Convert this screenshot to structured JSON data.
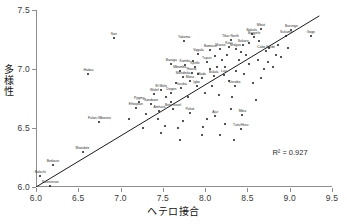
{
  "chart_data": {
    "type": "scatter",
    "title": "",
    "xlabel": "ヘテロ接合",
    "ylabel": "多様性",
    "xlim": [
      6.0,
      9.5
    ],
    "ylim": [
      6.0,
      7.5
    ],
    "xticks": [
      "6.0",
      "6.5",
      "7.0",
      "7.5",
      "8.0",
      "8.5",
      "9.0",
      "9.5"
    ],
    "yticks": [
      "6.0",
      "6.5",
      "7.0",
      "7.5"
    ],
    "grid": false,
    "legend": null,
    "annotations": [
      {
        "text": "R² = 0.927",
        "x": 9.15,
        "y": 6.28
      }
    ],
    "trendline": {
      "type": "linear",
      "x0": 6.0,
      "y0": 6.0,
      "x1": 9.35,
      "y1": 7.45,
      "r2": 0.927
    },
    "points": [
      {
        "label": "Palestinian",
        "x": 6.17,
        "y": 6.01
      },
      {
        "label": "Balochi",
        "x": 6.05,
        "y": 6.09
      },
      {
        "label": "Bedouin",
        "x": 6.2,
        "y": 6.19
      },
      {
        "label": "Mozabite",
        "x": 6.55,
        "y": 6.3
      },
      {
        "label": "Fulani Mbororo",
        "x": 6.75,
        "y": 6.55
      },
      {
        "label": "Hadza",
        "x": 6.62,
        "y": 6.96
      },
      {
        "label": "San",
        "x": 6.92,
        "y": 7.26
      },
      {
        "label": "Yakoma",
        "x": 7.75,
        "y": 7.24
      },
      {
        "label": "Tikar North",
        "x": 8.3,
        "y": 7.25
      },
      {
        "label": "Bakola",
        "x": 8.55,
        "y": 7.3
      },
      {
        "label": "Mbuti",
        "x": 8.66,
        "y": 7.34
      },
      {
        "label": "Bagyele",
        "x": 8.58,
        "y": 7.27
      },
      {
        "label": "Burunge",
        "x": 9.02,
        "y": 7.33
      },
      {
        "label": "Sukuma",
        "x": 8.96,
        "y": 7.28
      },
      {
        "label": "Gogo",
        "x": 9.25,
        "y": 7.28
      },
      {
        "label": "Baraga",
        "x": 7.6,
        "y": 7.04
      },
      {
        "label": "Vagala",
        "x": 7.92,
        "y": 7.13
      },
      {
        "label": "Bamoun",
        "x": 8.06,
        "y": 7.16
      },
      {
        "label": "Massa",
        "x": 8.18,
        "y": 7.17
      },
      {
        "label": "Malgas",
        "x": 8.36,
        "y": 7.17
      },
      {
        "label": "Kotu",
        "x": 8.28,
        "y": 7.19
      },
      {
        "label": "Sokoro",
        "x": 8.45,
        "y": 7.2
      },
      {
        "label": "Cabo Verde",
        "x": 8.72,
        "y": 7.15
      },
      {
        "label": "Kambu",
        "x": 7.76,
        "y": 7.03
      },
      {
        "label": "Kpelle",
        "x": 7.88,
        "y": 7.02
      },
      {
        "label": "Tupuri",
        "x": 8.02,
        "y": 7.06
      },
      {
        "label": "Mbamba",
        "x": 7.7,
        "y": 6.98
      },
      {
        "label": "Hausa",
        "x": 7.84,
        "y": 6.97
      },
      {
        "label": "Mandinka",
        "x": 7.74,
        "y": 6.93
      },
      {
        "label": "Mano",
        "x": 7.82,
        "y": 6.9
      },
      {
        "label": "Mada",
        "x": 7.96,
        "y": 6.92
      },
      {
        "label": "Bulala",
        "x": 8.1,
        "y": 6.94
      },
      {
        "label": "Luo",
        "x": 8.22,
        "y": 6.95
      },
      {
        "label": "El Molo",
        "x": 7.48,
        "y": 6.82
      },
      {
        "label": "Wolof",
        "x": 7.4,
        "y": 6.79
      },
      {
        "label": "Dogon",
        "x": 7.6,
        "y": 6.8
      },
      {
        "label": "Yoruba",
        "x": 7.72,
        "y": 6.84
      },
      {
        "label": "Igbo",
        "x": 7.9,
        "y": 6.86
      },
      {
        "label": "Dorobo",
        "x": 8.35,
        "y": 6.86
      },
      {
        "label": "Pygmy",
        "x": 7.22,
        "y": 6.72
      },
      {
        "label": "Sandawe",
        "x": 7.36,
        "y": 6.7
      },
      {
        "label": "Ethiopian",
        "x": 7.18,
        "y": 6.67
      },
      {
        "label": "Beta Israel",
        "x": 7.62,
        "y": 6.66
      },
      {
        "label": "Amhara",
        "x": 7.46,
        "y": 6.64
      },
      {
        "label": "Pokot",
        "x": 7.82,
        "y": 6.63
      },
      {
        "label": "Ajur",
        "x": 8.12,
        "y": 6.6
      },
      {
        "label": "Mbia",
        "x": 8.44,
        "y": 6.61
      },
      {
        "label": "Tutsi/Hutu",
        "x": 8.42,
        "y": 6.49
      },
      {
        "label": "",
        "x": 7.52,
        "y": 6.52
      },
      {
        "label": "",
        "x": 7.68,
        "y": 6.5
      },
      {
        "label": "",
        "x": 7.98,
        "y": 6.51
      },
      {
        "label": "",
        "x": 8.24,
        "y": 6.53
      },
      {
        "label": "",
        "x": 8.3,
        "y": 6.66
      },
      {
        "label": "",
        "x": 8.6,
        "y": 6.74
      },
      {
        "label": "",
        "x": 8.66,
        "y": 6.92
      },
      {
        "label": "",
        "x": 8.8,
        "y": 7.02
      },
      {
        "label": "",
        "x": 8.9,
        "y": 7.1
      },
      {
        "label": "",
        "x": 8.52,
        "y": 7.04
      },
      {
        "label": "",
        "x": 8.4,
        "y": 7.08
      },
      {
        "label": "",
        "x": 8.2,
        "y": 7.08
      },
      {
        "label": "",
        "x": 8.06,
        "y": 7.0
      },
      {
        "label": "",
        "x": 7.92,
        "y": 6.96
      },
      {
        "label": "",
        "x": 8.14,
        "y": 7.02
      },
      {
        "label": "",
        "x": 8.26,
        "y": 7.12
      },
      {
        "label": "",
        "x": 8.48,
        "y": 7.12
      },
      {
        "label": "",
        "x": 8.62,
        "y": 7.08
      },
      {
        "label": "",
        "x": 8.76,
        "y": 7.18
      },
      {
        "label": "",
        "x": 8.12,
        "y": 7.11
      },
      {
        "label": "",
        "x": 7.86,
        "y": 7.07
      },
      {
        "label": "",
        "x": 7.66,
        "y": 6.88
      },
      {
        "label": "",
        "x": 7.54,
        "y": 6.76
      },
      {
        "label": "",
        "x": 7.3,
        "y": 6.62
      },
      {
        "label": "",
        "x": 7.1,
        "y": 6.58
      },
      {
        "label": "",
        "x": 7.44,
        "y": 6.58
      },
      {
        "label": "",
        "x": 7.74,
        "y": 6.56
      },
      {
        "label": "",
        "x": 8.02,
        "y": 6.58
      },
      {
        "label": "",
        "x": 8.18,
        "y": 6.44
      },
      {
        "label": "",
        "x": 7.96,
        "y": 6.44
      },
      {
        "label": "",
        "x": 7.7,
        "y": 6.4
      },
      {
        "label": "",
        "x": 8.34,
        "y": 6.4
      },
      {
        "label": "",
        "x": 8.56,
        "y": 6.88
      },
      {
        "label": "",
        "x": 8.7,
        "y": 7.0
      },
      {
        "label": "",
        "x": 8.86,
        "y": 7.2
      },
      {
        "label": "",
        "x": 8.98,
        "y": 7.18
      },
      {
        "label": "",
        "x": 8.46,
        "y": 6.96
      },
      {
        "label": "",
        "x": 8.36,
        "y": 6.98
      },
      {
        "label": "",
        "x": 8.28,
        "y": 6.9
      },
      {
        "label": "",
        "x": 8.08,
        "y": 6.86
      },
      {
        "label": "",
        "x": 7.8,
        "y": 6.76
      },
      {
        "label": "",
        "x": 7.6,
        "y": 6.72
      },
      {
        "label": "",
        "x": 8.52,
        "y": 7.22
      },
      {
        "label": "",
        "x": 8.64,
        "y": 7.24
      },
      {
        "label": "",
        "x": 8.42,
        "y": 7.14
      },
      {
        "label": "",
        "x": 8.24,
        "y": 7.02
      },
      {
        "label": "",
        "x": 8.0,
        "y": 6.8
      },
      {
        "label": "",
        "x": 8.16,
        "y": 6.78
      },
      {
        "label": "",
        "x": 8.32,
        "y": 6.76
      },
      {
        "label": "",
        "x": 7.48,
        "y": 6.46
      },
      {
        "label": "",
        "x": 7.26,
        "y": 6.5
      },
      {
        "label": "",
        "x": 8.74,
        "y": 7.06
      },
      {
        "label": "",
        "x": 8.84,
        "y": 7.12
      }
    ]
  }
}
